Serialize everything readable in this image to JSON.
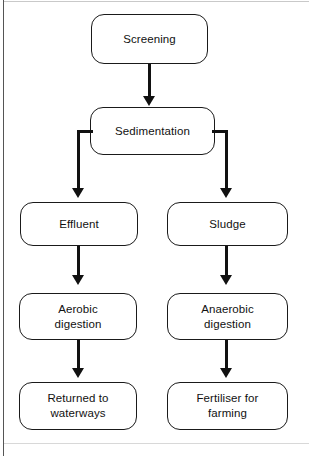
{
  "figure": {
    "type": "flowchart",
    "orientation": "top-to-bottom"
  },
  "nodes": [
    {
      "id": "screening",
      "label": "Screening"
    },
    {
      "id": "sedimentation",
      "label": "Sedimentation"
    },
    {
      "id": "effluent",
      "label": "Effluent"
    },
    {
      "id": "sludge",
      "label": "Sludge"
    },
    {
      "id": "aerobic-digestion",
      "label": "Aerobic\ndigestion"
    },
    {
      "id": "anaerobic-digestion",
      "label": "Anaerobic\ndigestion"
    },
    {
      "id": "returned-to-waterways",
      "label": "Returned to\nwaterways"
    },
    {
      "id": "fertiliser-for-farming",
      "label": "Fertiliser for\nfarming"
    }
  ],
  "edges": [
    {
      "from": "screening",
      "to": "sedimentation",
      "style": "straight-down"
    },
    {
      "from": "sedimentation",
      "to": "effluent",
      "style": "elbow-left-down"
    },
    {
      "from": "sedimentation",
      "to": "sludge",
      "style": "elbow-right-down"
    },
    {
      "from": "effluent",
      "to": "aerobic-digestion",
      "style": "straight-down"
    },
    {
      "from": "sludge",
      "to": "anaerobic-digestion",
      "style": "straight-down"
    },
    {
      "from": "aerobic-digestion",
      "to": "returned-to-waterways",
      "style": "straight-down"
    },
    {
      "from": "anaerobic-digestion",
      "to": "fertiliser-for-farming",
      "style": "straight-down"
    }
  ],
  "colors": {
    "stroke": "#1a1a1a",
    "background": "#ffffff",
    "text": "#111111",
    "frame": "#555555"
  }
}
